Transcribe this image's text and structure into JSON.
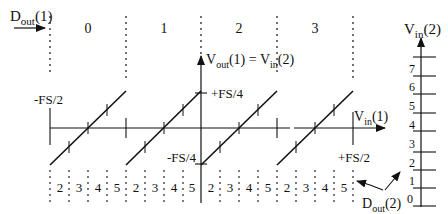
{
  "diagram": {
    "type": "two-stage pipelined ADC residue transfer",
    "top_axis": {
      "label_main": "D",
      "label_sub": "out",
      "label_suffix": "(1)",
      "codes": [
        "0",
        "1",
        "2",
        "3"
      ]
    },
    "vertical_axis": {
      "label_main": "V",
      "label_sub": "out",
      "label_suffix": "(1) = ",
      "label2_main": "V",
      "label2_sub": "in",
      "label2_suffix": "(2)",
      "top_tick": "+FS/4",
      "bottom_tick": "-FS/4"
    },
    "horizontal_axis": {
      "label_main": "V",
      "label_sub": "in",
      "label_suffix": "(1)",
      "left_tick": "-FS/2",
      "right_tick": "+FS/2"
    },
    "bottom_codes": [
      "2",
      "3",
      "4",
      "5",
      "2",
      "3",
      "4",
      "5",
      "2",
      "3",
      "4",
      "5",
      "2",
      "3",
      "4",
      "5"
    ],
    "right_scale": {
      "label_main": "V",
      "label_sub": "in",
      "label_suffix": "(2)",
      "ticks": [
        "0",
        "1",
        "2",
        "3",
        "4",
        "5",
        "6",
        "7"
      ]
    },
    "dout2_label": {
      "main": "D",
      "sub": "out",
      "suffix": "(2)"
    },
    "colors": {
      "ink": "#111111",
      "background": "#ffffff"
    }
  }
}
